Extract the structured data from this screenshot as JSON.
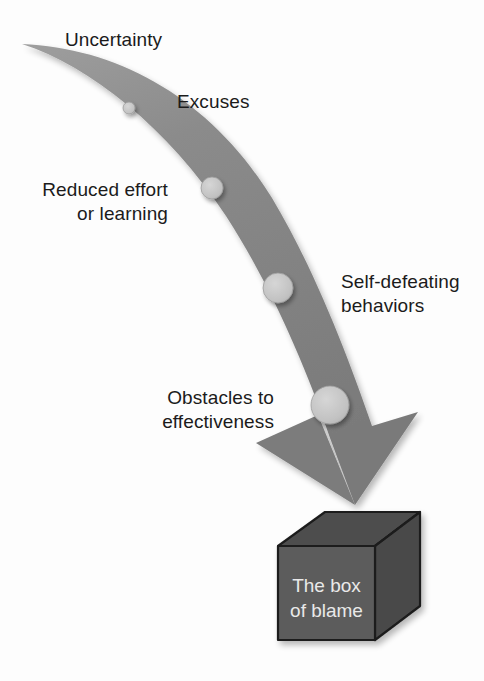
{
  "figure": {
    "type": "conceptual-flow-diagram",
    "title": "",
    "colors": {
      "background": "#fdfdfd",
      "arrow_fill": "#7b7b7b",
      "arrow_fill_light": "#9a9a9a",
      "circle_fill": "#c3c3c3",
      "circle_stroke": "#8d8d8d",
      "cube_front": "#5a5a5a",
      "cube_top": "#4b4b4b",
      "cube_side": "#484848",
      "cube_outline": "#1c1c1c",
      "text": "#1b1b1b",
      "box_text": "#e9e9e9"
    },
    "arrow": {
      "name": "downward-curving-arrow",
      "direction": "from upper-left tail to lower-right arrowhead",
      "stops": 4
    },
    "labels": [
      {
        "id": "uncertainty",
        "text": "Uncertainty",
        "align": "left",
        "x": 65,
        "y": 28,
        "circle_index": 0
      },
      {
        "id": "excuses",
        "text": "Excuses",
        "align": "left",
        "x": 177,
        "y": 90,
        "circle_index": 1
      },
      {
        "id": "reduced-effort",
        "text": "Reduced effort\nor learning",
        "align": "right",
        "x": 168,
        "y": 178,
        "circle_index": 2
      },
      {
        "id": "self-defeating",
        "text": "Self-defeating\nbehaviors",
        "align": "left",
        "x": 341,
        "y": 270,
        "circle_index": 3
      },
      {
        "id": "obstacles",
        "text": "Obstacles to\neffectiveness",
        "align": "right",
        "x": 274,
        "y": 386,
        "circle_index": 4
      }
    ],
    "circles": [
      {
        "id": "circle-excuses",
        "cx": 129,
        "cy": 108,
        "r": 6
      },
      {
        "id": "circle-reduced-effort",
        "cx": 212,
        "cy": 188,
        "r": 11
      },
      {
        "id": "circle-self-defeating",
        "cx": 278,
        "cy": 288,
        "r": 15
      },
      {
        "id": "circle-obstacles",
        "cx": 330,
        "cy": 405,
        "r": 19
      }
    ],
    "cube": {
      "id": "box-of-blame",
      "label_line_1": "The box",
      "label_line_2": "of blame",
      "front": {
        "x": 278,
        "y": 546,
        "w": 97,
        "h": 94
      }
    }
  }
}
